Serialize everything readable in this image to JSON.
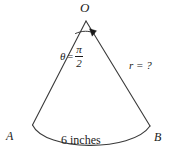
{
  "figure": {
    "type": "cone-sector-diagram",
    "background_color": "#ffffff",
    "stroke_color": "#3a3a3a",
    "text_color": "#1a1a1a",
    "labels": {
      "apex": "O",
      "left_base": "A",
      "right_base": "B",
      "radius": "r = ?",
      "arc_length": "6 inches",
      "angle_symbol": "θ",
      "angle_equals": "=",
      "angle_numerator": "π",
      "angle_denominator": "2"
    },
    "geometry": {
      "apex_x": 86,
      "apex_y": 21,
      "left_base_x": 32,
      "left_base_y": 125,
      "right_base_x": 150,
      "right_base_y": 126,
      "arc_bottom_y": 152
    }
  }
}
